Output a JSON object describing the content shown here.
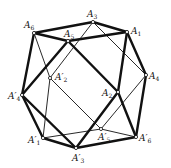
{
  "diagram": {
    "type": "polyhedron-projection",
    "vertices": [
      {
        "id": "A6",
        "label": "A",
        "sub": "6",
        "prime": false,
        "x": 34,
        "y": 33,
        "lx": 24,
        "ly": 28
      },
      {
        "id": "A3",
        "label": "A",
        "sub": "3",
        "prime": false,
        "x": 93,
        "y": 22,
        "lx": 87,
        "ly": 17
      },
      {
        "id": "A1",
        "label": "A",
        "sub": "1",
        "prime": false,
        "x": 127,
        "y": 32,
        "lx": 131,
        "ly": 34
      },
      {
        "id": "A5",
        "label": "A",
        "sub": "5",
        "prime": false,
        "x": 68,
        "y": 41,
        "lx": 64,
        "ly": 37
      },
      {
        "id": "A2p",
        "label": "A",
        "sub": "2",
        "prime": true,
        "x": 50,
        "y": 78,
        "lx": 55,
        "ly": 80
      },
      {
        "id": "A4",
        "label": "A",
        "sub": "4",
        "prime": false,
        "x": 146,
        "y": 75,
        "lx": 149,
        "ly": 79
      },
      {
        "id": "A4p",
        "label": "A",
        "sub": "4",
        "prime": true,
        "x": 22,
        "y": 95,
        "lx": 8,
        "ly": 99
      },
      {
        "id": "A2",
        "label": "A",
        "sub": "2",
        "prime": false,
        "x": 118,
        "y": 92,
        "lx": 102,
        "ly": 96
      },
      {
        "id": "A1p",
        "label": "A",
        "sub": "1",
        "prime": true,
        "x": 43,
        "y": 138,
        "lx": 28,
        "ly": 143
      },
      {
        "id": "A5p",
        "label": "A",
        "sub": "5",
        "prime": true,
        "x": 101,
        "y": 129,
        "lx": 98,
        "ly": 140
      },
      {
        "id": "A6p",
        "label": "A",
        "sub": "6",
        "prime": true,
        "x": 136,
        "y": 137,
        "lx": 139,
        "ly": 141
      },
      {
        "id": "A3p",
        "label": "A",
        "sub": "3",
        "prime": true,
        "x": 76,
        "y": 148,
        "lx": 72,
        "ly": 161
      }
    ],
    "edges_thick": [
      [
        "A6",
        "A3"
      ],
      [
        "A3",
        "A1"
      ],
      [
        "A6",
        "A5"
      ],
      [
        "A5",
        "A1"
      ],
      [
        "A6",
        "A4p"
      ],
      [
        "A1",
        "A4"
      ],
      [
        "A1",
        "A2"
      ],
      [
        "A5",
        "A4p"
      ],
      [
        "A5",
        "A2"
      ],
      [
        "A2",
        "A6p"
      ],
      [
        "A4",
        "A6p"
      ],
      [
        "A4p",
        "A1p"
      ],
      [
        "A4p",
        "A3p"
      ],
      [
        "A1p",
        "A3p"
      ],
      [
        "A3p",
        "A6p"
      ],
      [
        "A3p",
        "A2"
      ]
    ],
    "edges_thin": [
      [
        "A6",
        "A2p"
      ],
      [
        "A3",
        "A2p"
      ],
      [
        "A3",
        "A4"
      ],
      [
        "A2p",
        "A1p"
      ],
      [
        "A2p",
        "A5p"
      ],
      [
        "A4",
        "A5p"
      ],
      [
        "A1p",
        "A5p"
      ],
      [
        "A5p",
        "A6p"
      ]
    ],
    "colors": {
      "line": "#111111",
      "background": "#ffffff"
    }
  }
}
